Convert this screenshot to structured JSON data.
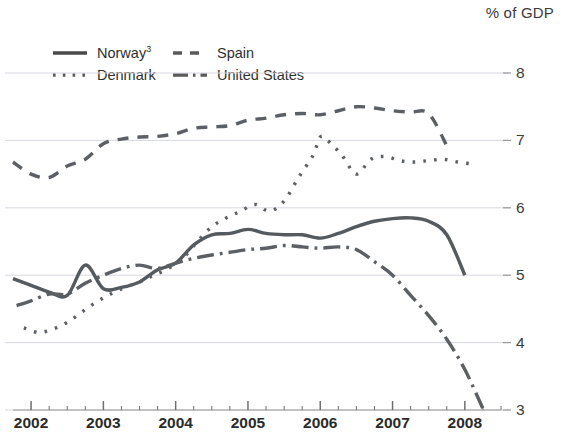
{
  "axis_unit_label": "% of GDP",
  "legend": [
    {
      "name": "Norway",
      "superscript": "3",
      "style": "solid"
    },
    {
      "name": "Spain",
      "superscript": "",
      "style": "dashed"
    },
    {
      "name": "Denmark",
      "superscript": "",
      "style": "dotted"
    },
    {
      "name": "United States",
      "superscript": "",
      "style": "dash-dot"
    }
  ],
  "chart_data": {
    "type": "line",
    "title": "",
    "xlabel": "",
    "ylabel": "% of GDP",
    "xlim": [
      2001.75,
      2008.5
    ],
    "ylim": [
      3,
      8
    ],
    "yticks": [
      3,
      4,
      5,
      6,
      7,
      8
    ],
    "xticks": [
      2002,
      2003,
      2004,
      2005,
      2006,
      2007,
      2008
    ],
    "minor_xticks_per_year": 4,
    "grid": true,
    "legend_position": "top-left",
    "series": [
      {
        "name": "Norway",
        "style": "solid",
        "x": [
          2001.75,
          2002.0,
          2002.25,
          2002.5,
          2002.75,
          2003.0,
          2003.25,
          2003.5,
          2003.75,
          2004.0,
          2004.25,
          2004.5,
          2004.75,
          2005.0,
          2005.25,
          2005.5,
          2005.75,
          2006.0,
          2006.25,
          2006.5,
          2006.75,
          2007.0,
          2007.25,
          2007.5,
          2007.75,
          2008.0
        ],
        "y": [
          4.95,
          4.85,
          4.75,
          4.7,
          5.15,
          4.8,
          4.82,
          4.9,
          5.08,
          5.18,
          5.45,
          5.6,
          5.62,
          5.68,
          5.62,
          5.6,
          5.6,
          5.55,
          5.62,
          5.72,
          5.8,
          5.84,
          5.85,
          5.8,
          5.6,
          5.0
        ]
      },
      {
        "name": "Spain",
        "style": "dashed",
        "x": [
          2001.75,
          2002.0,
          2002.25,
          2002.5,
          2002.75,
          2003.0,
          2003.25,
          2003.5,
          2003.75,
          2004.0,
          2004.25,
          2004.5,
          2004.75,
          2005.0,
          2005.25,
          2005.5,
          2005.75,
          2006.0,
          2006.25,
          2006.5,
          2006.75,
          2007.0,
          2007.25,
          2007.5,
          2007.75
        ],
        "y": [
          6.68,
          6.5,
          6.45,
          6.62,
          6.72,
          6.95,
          7.02,
          7.05,
          7.06,
          7.1,
          7.18,
          7.2,
          7.22,
          7.3,
          7.33,
          7.38,
          7.4,
          7.38,
          7.44,
          7.5,
          7.48,
          7.44,
          7.42,
          7.4,
          6.92
        ]
      },
      {
        "name": "Denmark",
        "style": "dotted",
        "x": [
          2001.9,
          2002.1,
          2002.3,
          2002.5,
          2002.7,
          2002.9,
          2003.1,
          2003.3,
          2003.5,
          2003.7,
          2003.9,
          2004.1,
          2004.3,
          2004.5,
          2004.7,
          2004.9,
          2005.1,
          2005.3,
          2005.5,
          2005.7,
          2005.9,
          2006.0,
          2006.1,
          2006.3,
          2006.5,
          2006.7,
          2006.9,
          2007.1,
          2007.3,
          2007.5,
          2007.7,
          2007.9,
          2008.1
        ],
        "y": [
          4.22,
          4.15,
          4.2,
          4.3,
          4.45,
          4.6,
          4.72,
          4.82,
          4.9,
          5.0,
          5.1,
          5.25,
          5.5,
          5.72,
          5.85,
          5.95,
          6.05,
          5.95,
          6.1,
          6.45,
          6.78,
          7.05,
          7.0,
          6.78,
          6.5,
          6.72,
          6.76,
          6.7,
          6.68,
          6.7,
          6.72,
          6.68,
          6.65
        ]
      },
      {
        "name": "United States",
        "style": "dash-dot",
        "x": [
          2001.8,
          2002.0,
          2002.25,
          2002.5,
          2002.75,
          2003.0,
          2003.25,
          2003.5,
          2003.75,
          2004.0,
          2004.25,
          2004.5,
          2004.75,
          2005.0,
          2005.25,
          2005.5,
          2005.75,
          2006.0,
          2006.25,
          2006.5,
          2006.75,
          2007.0,
          2007.25,
          2007.5,
          2007.75,
          2008.0,
          2008.25
        ],
        "y": [
          4.55,
          4.62,
          4.72,
          4.72,
          4.88,
          5.0,
          5.1,
          5.15,
          5.1,
          5.18,
          5.25,
          5.3,
          5.34,
          5.38,
          5.4,
          5.44,
          5.42,
          5.4,
          5.42,
          5.38,
          5.2,
          5.0,
          4.7,
          4.4,
          4.05,
          3.6,
          3.02
        ]
      }
    ]
  }
}
